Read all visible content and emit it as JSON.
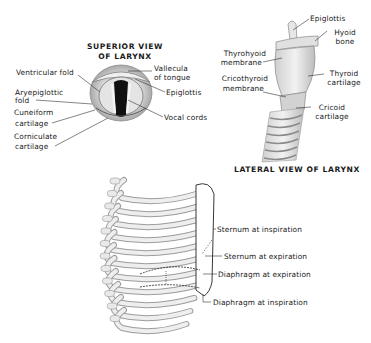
{
  "superior_view": {
    "title_line1": "SUPERIOR VIEW",
    "title_line2": "OF LARYNX",
    "labels": {
      "ventricular_fold": "Ventricular fold",
      "aryepiglottic_fold_1": "Aryepiglottic",
      "aryepiglottic_fold_2": "fold",
      "cuneiform_1": "Cuneiform",
      "cuneiform_2": "cartilage",
      "corniculate_1": "Corniculate",
      "corniculate_2": "cartilage",
      "vallecula_1": "Vallecula",
      "vallecula_2": "of tongue",
      "epiglottis": "Epiglottis",
      "vocal_cords": "Vocal cords"
    }
  },
  "lateral_view": {
    "title": "LATERAL VIEW OF LARYNX",
    "labels": {
      "epiglottis": "Epiglottis",
      "hyoid_1": "Hyoid",
      "hyoid_2": "bone",
      "thyrohyoid_1": "Thyrohyoid",
      "thyrohyoid_2": "membrane",
      "cricothyroid_1": "Cricothyroid",
      "cricothyroid_2": "membrane",
      "thyroid_1": "Thyroid",
      "thyroid_2": "cartilage",
      "cricoid_1": "Cricoid",
      "cricoid_2": "cartilage"
    }
  },
  "thorax": {
    "labels": {
      "sternum_inspiration": "Sternum at inspiration",
      "sternum_expiration": "Sternum at expiration",
      "diaphragm_expiration": "Diaphragm at expiration",
      "diaphragm_inspiration": "Diaphragm at inspiration"
    }
  }
}
